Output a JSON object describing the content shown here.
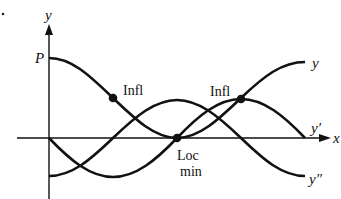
{
  "figure": {
    "type": "function-derivative-graph",
    "axes": {
      "x_label": "x",
      "y_label": "y",
      "y_intercept_label": "P"
    },
    "curves": [
      {
        "name": "y",
        "label": "y",
        "shape": "cosine, starts at max P, local min on x-axis at center"
      },
      {
        "name": "y-prime",
        "label": "y′",
        "shape": "negative sine, starts at 0"
      },
      {
        "name": "y-double-prime",
        "label": "y″",
        "shape": "negative cosine, starts at minimum"
      }
    ],
    "annotations": [
      {
        "label": "Infl",
        "on": "y",
        "where": "first inflection point"
      },
      {
        "label": "Infl",
        "on": "y",
        "where": "second inflection point"
      },
      {
        "label_line1": "Loc",
        "label_line2": "min",
        "on": "y",
        "where": "local minimum on x-axis"
      }
    ],
    "color": "#111111",
    "bullet": "•"
  }
}
